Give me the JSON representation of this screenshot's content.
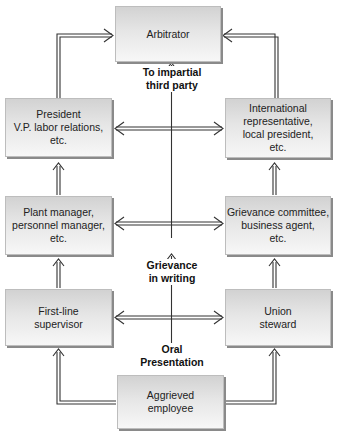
{
  "diagram": {
    "type": "flowchart",
    "nodes": {
      "arbitrator": "Arbitrator",
      "president": "President\nV.P. labor relations,\netc.",
      "international": "International\nrepresentative,\nlocal president,\netc.",
      "plant_manager": "Plant manager,\npersonnel manager,\netc.",
      "grievance_committee": "Grievance committee,\nbusiness agent,\netc.",
      "first_line": "First-line\nsupervisor",
      "union_steward": "Union\nsteward",
      "aggrieved": "Aggrieved\nemployee"
    },
    "stage_labels": {
      "third_party": "To impartial\nthird party",
      "writing": "Grievance\nin writing",
      "oral": "Oral\nPresentation"
    },
    "edges": [
      {
        "from": "aggrieved",
        "to": "first_line",
        "style": "double-line arrow"
      },
      {
        "from": "aggrieved",
        "to": "union_steward",
        "style": "double-line arrow"
      },
      {
        "from": "first_line",
        "to": "union_steward",
        "style": "bidirectional"
      },
      {
        "from": "first_line",
        "to": "plant_manager",
        "style": "double-line arrow"
      },
      {
        "from": "union_steward",
        "to": "grievance_committee",
        "style": "double-line arrow"
      },
      {
        "from": "plant_manager",
        "to": "grievance_committee",
        "style": "bidirectional"
      },
      {
        "from": "plant_manager",
        "to": "president",
        "style": "double-line arrow"
      },
      {
        "from": "grievance_committee",
        "to": "international",
        "style": "double-line arrow"
      },
      {
        "from": "president",
        "to": "international",
        "style": "bidirectional"
      },
      {
        "from": "president",
        "to": "arbitrator",
        "style": "double-line arrow"
      },
      {
        "from": "international",
        "to": "arbitrator",
        "style": "double-line arrow"
      },
      {
        "from": "oral_presentation",
        "to": "grievance_in_writing",
        "style": "single arrow"
      },
      {
        "from": "grievance_in_writing",
        "to": "third_party",
        "style": "single arrow"
      },
      {
        "from": "third_party",
        "to": "arbitrator",
        "style": "single arrow"
      }
    ]
  }
}
